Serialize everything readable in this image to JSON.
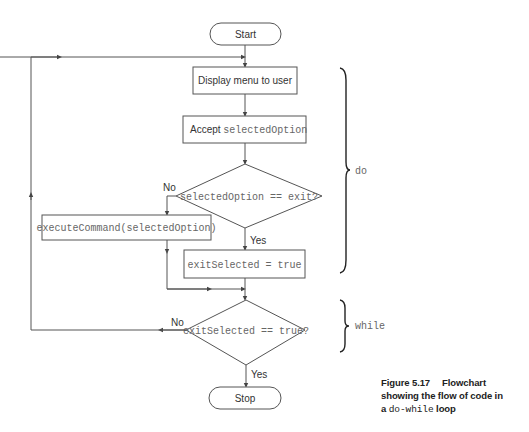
{
  "nodes": {
    "start": "Start",
    "display_menu": "Display menu to user",
    "accept_prefix": "Accept ",
    "accept_code": "selectedOption",
    "decision1": "selectedOption == exit?",
    "execute": "executeCommand(selectedOption)",
    "set_exit": "exitSelected = true",
    "decision2": "exitSelected == true?",
    "stop": "Stop"
  },
  "edges": {
    "d1_no": "No",
    "d1_yes": "Yes",
    "d2_no": "No",
    "d2_yes": "Yes"
  },
  "braces": {
    "do": "do",
    "while": "while"
  },
  "caption": {
    "figure": "Figure 5.17",
    "line1": "Flowchart",
    "line2": "showing the flow of code in",
    "line3_pre": "a ",
    "line3_code": "do-while",
    "line3_post": " loop"
  },
  "colors": {
    "stroke": "#555555",
    "text": "#333333",
    "code_text": "#666666"
  }
}
